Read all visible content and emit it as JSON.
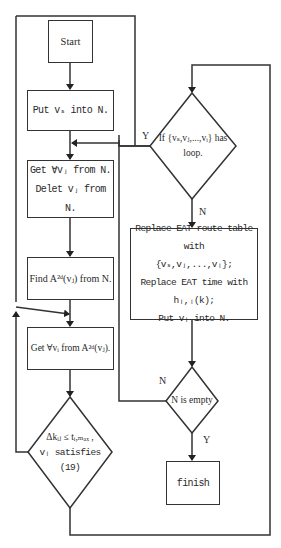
{
  "diagram": {
    "nodes": {
      "start": {
        "label": "Start"
      },
      "put_vs": {
        "label": "Put vₛ into N."
      },
      "get_delete": {
        "line1": "Get ∀vⱼ from N.",
        "line2": "Delet vⱼ from N."
      },
      "find": {
        "label": "Find A²ᵈ(vⱼ) from N."
      },
      "get_from_a": {
        "label": "Get ∀vᵢ from A²ᵈ(vⱼ)."
      },
      "condition_delta": {
        "line1": "Δkᵢⱼ ≤ tᵢ,ₘₐₓ ,",
        "line2": "vᵢ satisfies (19)"
      },
      "loop_check": {
        "line1": "If {vₛ,vⱼ,...,vᵢ} has",
        "line2": "loop."
      },
      "replace": {
        "line1": "Replace EAT route table with",
        "line2": "{vₛ,vⱼ,...,vᵢ};",
        "line3": "Replace EAT time with hᵢ,ᵢ(k);",
        "line4": "Put vᵢ into N."
      },
      "n_empty": {
        "label": "N is empty"
      },
      "finish": {
        "label": "finish"
      }
    },
    "edge_labels": {
      "loop_yes": "Y",
      "loop_no": "N",
      "empty_no": "N",
      "empty_yes": "Y"
    },
    "colors": {
      "stroke": "#333333",
      "background": "#ffffff",
      "text": "#2a2a2a"
    }
  }
}
